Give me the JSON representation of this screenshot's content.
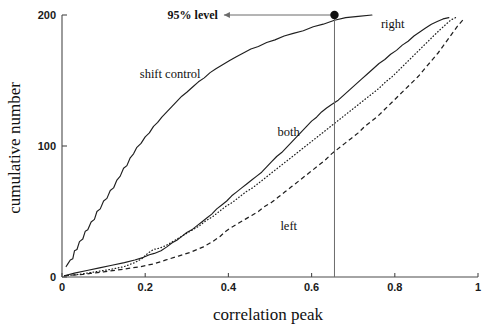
{
  "chart_data": {
    "type": "line",
    "title": "",
    "subtitle": "",
    "xlabel": "correlation peak",
    "ylabel": "cumulative number",
    "xlim": [
      0,
      1
    ],
    "ylim": [
      0,
      200
    ],
    "xticks": [
      "0",
      "0.2",
      "0.4",
      "0.6",
      "0.8",
      "1"
    ],
    "xtick_values": [
      0,
      0.2,
      0.4,
      0.6,
      0.8,
      1
    ],
    "yticks": [
      "0",
      "100",
      "200"
    ],
    "ytick_values": [
      0,
      100,
      200
    ],
    "grid": false,
    "legend_position": "inline-labels",
    "series": [
      {
        "name": "shift control",
        "style": "solid",
        "label_x": 0.26,
        "label_y": 152,
        "points": [
          [
            0.01,
            8
          ],
          [
            0.014,
            10
          ],
          [
            0.02,
            13
          ],
          [
            0.026,
            14
          ],
          [
            0.03,
            20
          ],
          [
            0.036,
            21
          ],
          [
            0.042,
            27
          ],
          [
            0.05,
            29
          ],
          [
            0.056,
            35
          ],
          [
            0.062,
            36
          ],
          [
            0.07,
            42
          ],
          [
            0.078,
            44
          ],
          [
            0.084,
            50
          ],
          [
            0.092,
            52
          ],
          [
            0.1,
            58
          ],
          [
            0.108,
            60
          ],
          [
            0.116,
            66
          ],
          [
            0.124,
            68
          ],
          [
            0.132,
            74
          ],
          [
            0.14,
            77
          ],
          [
            0.148,
            83
          ],
          [
            0.156,
            85
          ],
          [
            0.164,
            91
          ],
          [
            0.172,
            94
          ],
          [
            0.18,
            99
          ],
          [
            0.19,
            102
          ],
          [
            0.2,
            107
          ],
          [
            0.21,
            110
          ],
          [
            0.22,
            115
          ],
          [
            0.23,
            118
          ],
          [
            0.24,
            122
          ],
          [
            0.252,
            126
          ],
          [
            0.264,
            130
          ],
          [
            0.276,
            134
          ],
          [
            0.288,
            138
          ],
          [
            0.3,
            141
          ],
          [
            0.314,
            145
          ],
          [
            0.328,
            149
          ],
          [
            0.342,
            152
          ],
          [
            0.356,
            156
          ],
          [
            0.37,
            159
          ],
          [
            0.386,
            162
          ],
          [
            0.402,
            165
          ],
          [
            0.418,
            168
          ],
          [
            0.436,
            171
          ],
          [
            0.454,
            174
          ],
          [
            0.472,
            176
          ],
          [
            0.492,
            179
          ],
          [
            0.512,
            181
          ],
          [
            0.534,
            184
          ],
          [
            0.556,
            186
          ],
          [
            0.58,
            188
          ],
          [
            0.604,
            191
          ],
          [
            0.628,
            193
          ],
          [
            0.655,
            196
          ],
          [
            0.682,
            198
          ],
          [
            0.712,
            199
          ],
          [
            0.745,
            200
          ]
        ]
      },
      {
        "name": "both",
        "style": "solid",
        "label_x": 0.545,
        "label_y": 108,
        "points": [
          [
            0.006,
            1
          ],
          [
            0.03,
            3
          ],
          [
            0.06,
            5
          ],
          [
            0.09,
            7
          ],
          [
            0.12,
            9
          ],
          [
            0.15,
            11
          ],
          [
            0.175,
            13
          ],
          [
            0.196,
            15
          ],
          [
            0.21,
            17
          ],
          [
            0.222,
            18
          ],
          [
            0.238,
            20
          ],
          [
            0.252,
            23
          ],
          [
            0.264,
            26
          ],
          [
            0.276,
            28
          ],
          [
            0.288,
            31
          ],
          [
            0.3,
            34
          ],
          [
            0.312,
            36
          ],
          [
            0.324,
            39
          ],
          [
            0.336,
            42
          ],
          [
            0.348,
            45
          ],
          [
            0.36,
            48
          ],
          [
            0.372,
            52
          ],
          [
            0.384,
            55
          ],
          [
            0.396,
            58
          ],
          [
            0.408,
            62
          ],
          [
            0.42,
            65
          ],
          [
            0.432,
            68
          ],
          [
            0.444,
            71
          ],
          [
            0.456,
            74
          ],
          [
            0.468,
            77
          ],
          [
            0.48,
            80
          ],
          [
            0.492,
            84
          ],
          [
            0.504,
            88
          ],
          [
            0.516,
            92
          ],
          [
            0.528,
            95
          ],
          [
            0.54,
            99
          ],
          [
            0.552,
            103
          ],
          [
            0.564,
            107
          ],
          [
            0.576,
            111
          ],
          [
            0.588,
            115
          ],
          [
            0.6,
            119
          ],
          [
            0.612,
            122
          ],
          [
            0.624,
            126
          ],
          [
            0.636,
            129
          ],
          [
            0.65,
            132
          ],
          [
            0.664,
            135
          ],
          [
            0.678,
            139
          ],
          [
            0.692,
            143
          ],
          [
            0.706,
            147
          ],
          [
            0.72,
            151
          ],
          [
            0.734,
            155
          ],
          [
            0.748,
            159
          ],
          [
            0.762,
            163
          ],
          [
            0.776,
            166
          ],
          [
            0.79,
            170
          ],
          [
            0.804,
            173
          ],
          [
            0.818,
            177
          ],
          [
            0.832,
            180
          ],
          [
            0.846,
            184
          ],
          [
            0.86,
            187
          ],
          [
            0.874,
            190
          ],
          [
            0.888,
            193
          ],
          [
            0.902,
            195
          ],
          [
            0.916,
            197
          ],
          [
            0.93,
            198
          ]
        ]
      },
      {
        "name": "right",
        "style": "dotted",
        "label_x": 0.795,
        "label_y": 190,
        "points": [
          [
            0.006,
            1
          ],
          [
            0.04,
            2
          ],
          [
            0.08,
            4
          ],
          [
            0.12,
            6
          ],
          [
            0.15,
            8
          ],
          [
            0.175,
            11
          ],
          [
            0.192,
            14
          ],
          [
            0.206,
            18
          ],
          [
            0.22,
            21
          ],
          [
            0.234,
            22
          ],
          [
            0.25,
            24
          ],
          [
            0.266,
            27
          ],
          [
            0.282,
            30
          ],
          [
            0.298,
            33
          ],
          [
            0.314,
            36
          ],
          [
            0.33,
            39
          ],
          [
            0.346,
            43
          ],
          [
            0.362,
            46
          ],
          [
            0.378,
            50
          ],
          [
            0.394,
            54
          ],
          [
            0.41,
            57
          ],
          [
            0.426,
            61
          ],
          [
            0.442,
            65
          ],
          [
            0.458,
            68
          ],
          [
            0.474,
            72
          ],
          [
            0.49,
            76
          ],
          [
            0.506,
            80
          ],
          [
            0.522,
            84
          ],
          [
            0.538,
            88
          ],
          [
            0.554,
            92
          ],
          [
            0.57,
            96
          ],
          [
            0.586,
            100
          ],
          [
            0.602,
            104
          ],
          [
            0.618,
            108
          ],
          [
            0.634,
            112
          ],
          [
            0.65,
            116
          ],
          [
            0.666,
            120
          ],
          [
            0.682,
            124
          ],
          [
            0.698,
            128
          ],
          [
            0.714,
            132
          ],
          [
            0.73,
            136
          ],
          [
            0.746,
            140
          ],
          [
            0.762,
            144
          ],
          [
            0.778,
            149
          ],
          [
            0.794,
            153
          ],
          [
            0.81,
            158
          ],
          [
            0.826,
            163
          ],
          [
            0.842,
            168
          ],
          [
            0.858,
            173
          ],
          [
            0.874,
            178
          ],
          [
            0.89,
            183
          ],
          [
            0.906,
            188
          ],
          [
            0.92,
            192
          ],
          [
            0.934,
            196
          ],
          [
            0.946,
            198
          ]
        ]
      },
      {
        "name": "left",
        "style": "dashed",
        "label_x": 0.545,
        "label_y": 36,
        "points": [
          [
            0.006,
            1
          ],
          [
            0.05,
            2
          ],
          [
            0.1,
            4
          ],
          [
            0.15,
            6
          ],
          [
            0.19,
            8
          ],
          [
            0.22,
            10
          ],
          [
            0.25,
            13
          ],
          [
            0.28,
            16
          ],
          [
            0.31,
            19
          ],
          [
            0.34,
            23
          ],
          [
            0.362,
            27
          ],
          [
            0.38,
            31
          ],
          [
            0.394,
            35
          ],
          [
            0.408,
            38
          ],
          [
            0.424,
            41
          ],
          [
            0.44,
            44
          ],
          [
            0.456,
            47
          ],
          [
            0.472,
            50
          ],
          [
            0.488,
            54
          ],
          [
            0.504,
            57
          ],
          [
            0.52,
            61
          ],
          [
            0.536,
            65
          ],
          [
            0.552,
            69
          ],
          [
            0.568,
            73
          ],
          [
            0.584,
            77
          ],
          [
            0.6,
            81
          ],
          [
            0.616,
            85
          ],
          [
            0.632,
            89
          ],
          [
            0.648,
            94
          ],
          [
            0.664,
            98
          ],
          [
            0.68,
            102
          ],
          [
            0.696,
            106
          ],
          [
            0.712,
            110
          ],
          [
            0.728,
            115
          ],
          [
            0.744,
            119
          ],
          [
            0.76,
            123
          ],
          [
            0.776,
            128
          ],
          [
            0.792,
            133
          ],
          [
            0.808,
            138
          ],
          [
            0.824,
            143
          ],
          [
            0.84,
            148
          ],
          [
            0.856,
            153
          ],
          [
            0.872,
            159
          ],
          [
            0.888,
            165
          ],
          [
            0.904,
            171
          ],
          [
            0.92,
            178
          ],
          [
            0.936,
            185
          ],
          [
            0.952,
            192
          ],
          [
            0.966,
            197
          ]
        ]
      }
    ],
    "annotations": [
      {
        "name": "95-level",
        "text": "95% level",
        "arrow": "left",
        "marker_x": 0.655,
        "marker_y": 200,
        "vline_x": 0.655,
        "text_x": 0.37,
        "text_y": 200
      }
    ]
  }
}
